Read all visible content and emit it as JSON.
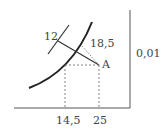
{
  "diagram": {
    "labels": {
      "isoquant_value": "12",
      "line_value": "18,5",
      "point_label": "A",
      "right_axis_value": "0,01",
      "x_tick_1": "14,5",
      "x_tick_2": "25"
    },
    "colors": {
      "stroke": "#333333",
      "dashed": "#666666",
      "text": "#444444"
    }
  }
}
